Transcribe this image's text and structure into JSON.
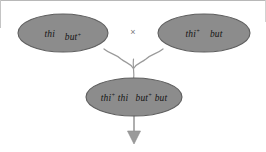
{
  "figure": {
    "type": "genetic-cross-diagram",
    "background_color": "#ffffff",
    "ellipse_fill": "#8c8c8c",
    "ellipse_stroke": "#5a5a5a",
    "text_color": "#151515",
    "connector_color": "#8a8a8a",
    "arrow_color": "#8a8a8a",
    "cross_symbol_color": "#7a7a7a"
  },
  "parent_left": {
    "label": "parent-genotype-left",
    "allele_1": "thi",
    "allele_1_sup": "",
    "allele_2": "but",
    "allele_2_sup": "+",
    "full_text": "thi but⁺"
  },
  "parent_right": {
    "label": "parent-genotype-right",
    "allele_1": "thi",
    "allele_1_sup": "+",
    "allele_2": "but",
    "allele_2_sup": "",
    "full_text": "thi⁺ but"
  },
  "cross": {
    "symbol": "×",
    "name": "cross-operator"
  },
  "offspring": {
    "label": "offspring-genotype",
    "allele_1": "thi",
    "allele_1_sup": "+",
    "allele_2": "thi",
    "allele_2_sup": "",
    "allele_3": "but",
    "allele_3_sup": "+",
    "allele_4": "but",
    "allele_4_sup": "",
    "full_text": "thi⁺thi but⁺but"
  },
  "arrow": {
    "name": "result-arrow",
    "direction": "down"
  }
}
